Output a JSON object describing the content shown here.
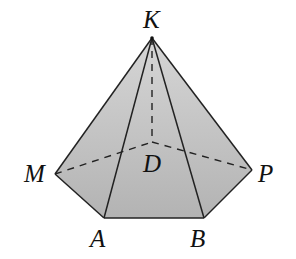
{
  "diagram": {
    "type": "pyramid",
    "colors": {
      "face_fill": "#b8b8b8",
      "face_fill_light": "#cfcfcf",
      "edge": "#222222",
      "background": "#ffffff"
    },
    "vertices": {
      "K": {
        "label": "K",
        "x": 152,
        "y": 38
      },
      "M": {
        "label": "M",
        "x": 55,
        "y": 174
      },
      "A": {
        "label": "A",
        "x": 104,
        "y": 218
      },
      "B": {
        "label": "B",
        "x": 204,
        "y": 218
      },
      "P": {
        "label": "P",
        "x": 252,
        "y": 170
      },
      "D": {
        "label": "D",
        "x": 152,
        "y": 142
      }
    },
    "visible_edges": [
      "KM",
      "KA",
      "KB",
      "KP",
      "MA",
      "AB",
      "BP"
    ],
    "hidden_edges": [
      "KD",
      "MD",
      "DP"
    ]
  }
}
